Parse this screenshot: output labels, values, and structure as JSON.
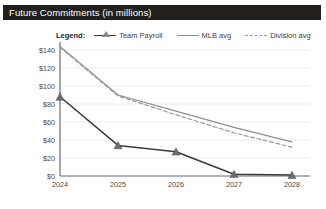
{
  "title": "Future Commitments (in millions)",
  "legend": {
    "label": "Legend:",
    "items": [
      {
        "name": "Team Payroll",
        "marker": "triangle-marker-icon",
        "style": "solid",
        "color": "#3a3a3a"
      },
      {
        "name": "MLB avg",
        "marker": "line-marker-icon",
        "style": "solid",
        "color": "#8f8f8f"
      },
      {
        "name": "Division avg",
        "marker": "dashed-line-marker-icon",
        "style": "dashed",
        "color": "#9a9a9a"
      }
    ]
  },
  "chart_data": {
    "type": "line",
    "title": "Future Commitments (in millions)",
    "xlabel": "",
    "ylabel": "",
    "categories": [
      "2024",
      "2025",
      "2026",
      "2027",
      "2028"
    ],
    "x": [
      2024,
      2025,
      2026,
      2027,
      2028
    ],
    "series": [
      {
        "name": "Team Payroll",
        "values": [
          88,
          34,
          27,
          2,
          1
        ],
        "color": "#3a3a3a",
        "style": "solid",
        "marker": "triangle"
      },
      {
        "name": "MLB avg",
        "values": [
          144,
          90,
          72,
          54,
          38
        ],
        "color": "#8f8f8f",
        "style": "solid",
        "marker": "none"
      },
      {
        "name": "Division avg",
        "values": [
          143,
          89,
          68,
          48,
          32
        ],
        "color": "#9a9a9a",
        "style": "dashed",
        "marker": "none"
      }
    ],
    "ylim": [
      0,
      150
    ],
    "yticks": [
      0,
      20,
      40,
      60,
      80,
      100,
      120,
      140
    ],
    "ytick_labels": [
      "$0",
      "$20",
      "$40",
      "$60",
      "$80",
      "$100",
      "$120",
      "$140"
    ],
    "xtick_labels": [
      "2024",
      "2025",
      "2026",
      "2027",
      "2028"
    ],
    "grid": true,
    "legend_position": "top"
  },
  "colors": {
    "title_bar_bg": "#221f1f",
    "title_text": "#ffffff",
    "plot_bg": "#ffffff",
    "grid": "#e6e6e6",
    "axis": "#6e6e6e",
    "tick_text": "#4a4a4a"
  }
}
